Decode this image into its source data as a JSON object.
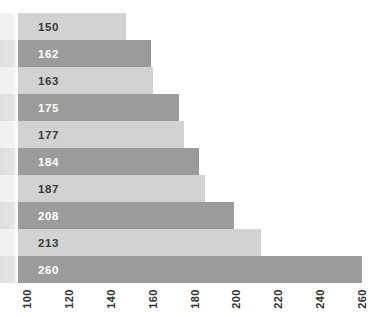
{
  "chart_data": {
    "type": "bar",
    "orientation": "horizontal",
    "title": "",
    "xlabel": "",
    "ylabel": "",
    "xlim": [
      100,
      260
    ],
    "grid": false,
    "legend": false,
    "x_tick_labels": [
      "100",
      "120",
      "140",
      "160",
      "180",
      "200",
      "220",
      "240",
      "260"
    ],
    "x_tick_values": [
      100,
      120,
      140,
      160,
      180,
      200,
      220,
      240,
      260
    ],
    "x_tick_rotation_deg": -90,
    "bar_value_labels": [
      "150",
      "162",
      "163",
      "175",
      "177",
      "184",
      "187",
      "208",
      "213",
      "260"
    ],
    "values": [
      150,
      162,
      163,
      175,
      177,
      184,
      187,
      208,
      213,
      260
    ],
    "bar_lengths_axis_units": [
      150,
      162,
      163,
      175,
      177,
      184,
      187,
      200.5,
      213,
      260
    ],
    "bar_shades": [
      "light",
      "dark",
      "light",
      "dark",
      "light",
      "dark",
      "light",
      "dark",
      "light",
      "dark"
    ],
    "colors": {
      "bar_light": "#d2d2d2",
      "bar_dark": "#9b9b9b",
      "label_on_light": "#3b3b3b",
      "label_on_dark": "#ffffff",
      "tick_label": "#303030",
      "background": "#ffffff"
    }
  }
}
